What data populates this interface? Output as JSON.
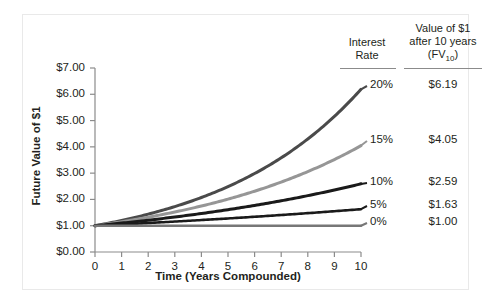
{
  "chart_data": {
    "type": "line",
    "title": "",
    "xlabel": "Time (Years Compounded)",
    "ylabel": "Future Value of $1",
    "xlim": [
      0,
      10
    ],
    "ylim": [
      0,
      7
    ],
    "grid": false,
    "legend_position": "right-table",
    "x": [
      0,
      1,
      2,
      3,
      4,
      5,
      6,
      7,
      8,
      9,
      10
    ],
    "xticklabels": [
      "0",
      "1",
      "2",
      "3",
      "4",
      "5",
      "6",
      "7",
      "8",
      "9",
      "10"
    ],
    "yticklabels": [
      "$0.00",
      "$1.00",
      "$2.00",
      "$3.00",
      "$4.00",
      "$5.00",
      "$6.00",
      "$7.00"
    ],
    "yticks": [
      0,
      1,
      2,
      3,
      4,
      5,
      6,
      7
    ],
    "series": [
      {
        "name": "20%",
        "rate": 0.2,
        "color": "#4a4a4a",
        "fv10": "$6.19",
        "values": [
          1.0,
          1.2,
          1.44,
          1.73,
          2.07,
          2.49,
          2.99,
          3.58,
          4.3,
          5.16,
          6.19
        ]
      },
      {
        "name": "15%",
        "rate": 0.15,
        "color": "#969696",
        "fv10": "$4.05",
        "values": [
          1.0,
          1.15,
          1.32,
          1.52,
          1.75,
          2.01,
          2.31,
          2.66,
          3.06,
          3.52,
          4.05
        ]
      },
      {
        "name": "10%",
        "rate": 0.1,
        "color": "#1a1a1a",
        "fv10": "$2.59",
        "values": [
          1.0,
          1.1,
          1.21,
          1.33,
          1.46,
          1.61,
          1.77,
          1.95,
          2.14,
          2.36,
          2.59
        ]
      },
      {
        "name": "5%",
        "rate": 0.05,
        "color": "#1a1a1a",
        "fv10": "$1.63",
        "values": [
          1.0,
          1.05,
          1.1,
          1.16,
          1.22,
          1.28,
          1.34,
          1.41,
          1.48,
          1.55,
          1.63
        ]
      },
      {
        "name": "0%",
        "rate": 0.0,
        "color": "#777777",
        "fv10": "$1.00",
        "values": [
          1.0,
          1.0,
          1.0,
          1.0,
          1.0,
          1.0,
          1.0,
          1.0,
          1.0,
          1.0,
          1.0
        ]
      }
    ]
  },
  "legend_table": {
    "header_rate_line1": "Interest",
    "header_rate_line2": "Rate",
    "header_value_line1": "Value of $1",
    "header_value_line2": "after 10 years",
    "header_value_line3_pre": "(FV",
    "header_value_line3_sub": "10",
    "header_value_line3_post": ")",
    "rows": [
      {
        "rate": "20%",
        "value": "$6.19"
      },
      {
        "rate": "15%",
        "value": "$4.05"
      },
      {
        "rate": "10%",
        "value": "$2.59"
      },
      {
        "rate": "5%",
        "value": "$1.63"
      },
      {
        "rate": "0%",
        "value": "$1.00"
      }
    ]
  },
  "axes": {
    "y_title": "Future Value of $1",
    "x_title": "Time (Years Compounded)"
  }
}
